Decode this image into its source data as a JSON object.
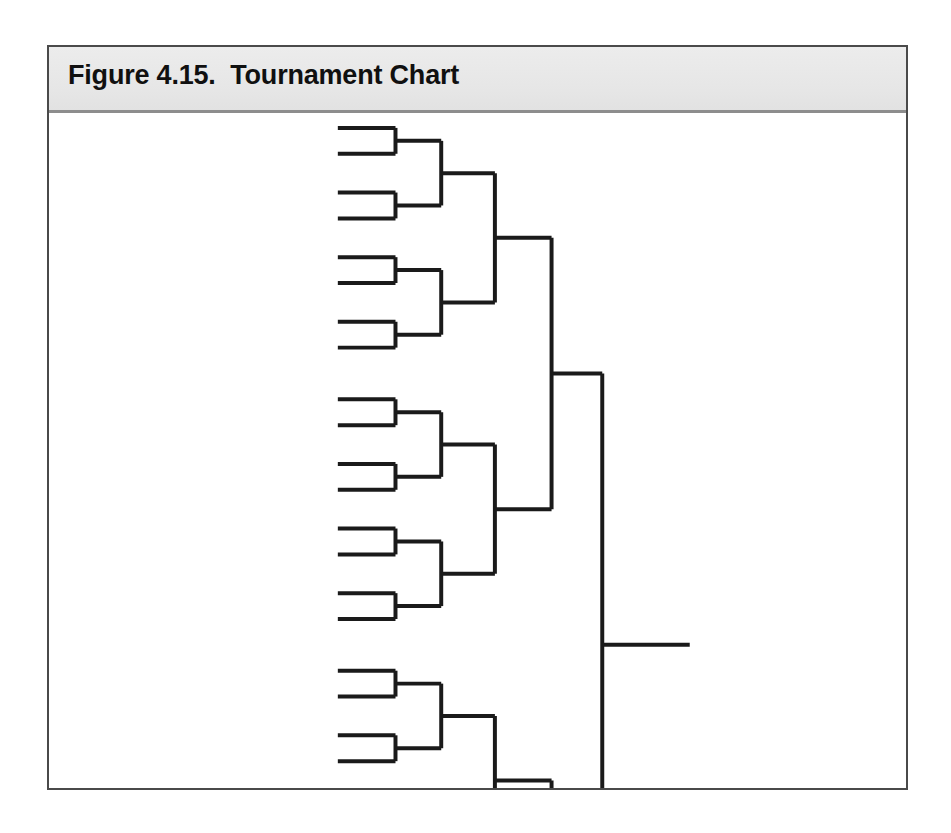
{
  "figure": {
    "caption_label": "Figure 4.15.",
    "caption_title": "Tournament Chart",
    "caption_full": "Figure 4.15.  Tournament Chart"
  },
  "colors": {
    "page_background": "#ffffff",
    "frame_border": "#4a4a4a",
    "caption_band": "#e9e9e9",
    "caption_rule": "#8d8d8d",
    "caption_text": "#101010",
    "bracket_line": "#1a1a1a"
  },
  "chart_data": {
    "type": "diagram",
    "diagram_kind": "single-elimination-tournament-bracket",
    "title": "Tournament Chart",
    "entries": 32,
    "rounds": 5,
    "orientation": "left-to-right",
    "has_labels": false,
    "round_names": [
      "Round of 32",
      "Round of 16",
      "Quarterfinals",
      "Semifinals",
      "Final"
    ],
    "matches_per_round": [
      16,
      8,
      4,
      2,
      1
    ],
    "line_width_px": 4,
    "geometry": {
      "view_width": 861,
      "view_height": 676,
      "leaf_x_start": 290,
      "column_x": [
        348,
        394,
        448,
        505,
        556,
        600
      ],
      "champion_x_end": 598,
      "leaf_y_first": 12,
      "leaf_pair_gap": 26,
      "leaf_group_pitch": 39
    }
  }
}
